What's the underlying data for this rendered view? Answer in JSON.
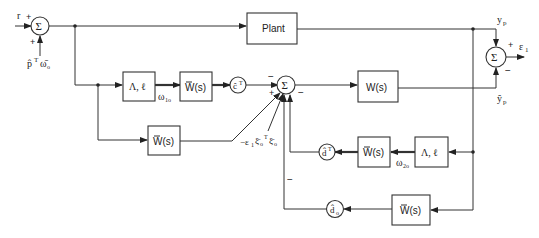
{
  "diagram": {
    "type": "block-diagram",
    "blocks": {
      "plant": "Plant",
      "lambda_l_upper": "Λ, ℓ",
      "wbar_upper": "W(s)",
      "wbar_middle": "W(s)",
      "w_model": "W(s)",
      "wbar_lower_right": "W(s)",
      "lambda_l_lower": "Λ, ℓ",
      "wbar_bottom": "W(s)"
    },
    "gains": {
      "c_hat": "ĉ",
      "c_sup": "T",
      "d_hat": "d̂",
      "d_sup": "T",
      "d0_hat": "d̂",
      "d0_sub": "o"
    },
    "summers": {
      "input": "Σ",
      "main": "Σ",
      "error": "Σ"
    },
    "signals": {
      "r": "r",
      "p_omega_p": "p̂",
      "p_omega_T": "T",
      "p_omega_w": "ω̄",
      "p_omega_sub": "o",
      "omega1": "ω",
      "omega1_sub": "1o",
      "omega2": "ω",
      "omega2_sub": "2o",
      "yp": "y",
      "yp_sub": "p",
      "yp_hat": "ŷ",
      "yp_hat_sub": "p",
      "e1": "ε",
      "e1_sub": "1",
      "xi_term_prefix": "−ε",
      "xi_term_sub1": "1",
      "xi_term_xi": "ξ̄",
      "xi_term_o": "o",
      "xi_term_T": "T"
    },
    "signs": {
      "plus": "+",
      "minus": "−"
    }
  }
}
